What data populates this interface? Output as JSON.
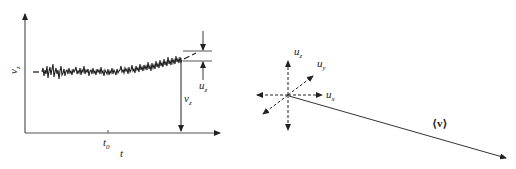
{
  "left_panel": {
    "y_axis_label": "v",
    "y_axis_label_sub": "z",
    "x_axis_label": "t",
    "x_tick_label": "t",
    "x_tick_label_sub": "0",
    "mean_label": "v",
    "mean_label_sub": "z",
    "fluct_label": "u",
    "fluct_label_sub": "z"
  },
  "right_panel": {
    "uz_label": "u",
    "uz_sub": "z",
    "uy_label": "u",
    "uy_sub": "y",
    "ux_label": "u",
    "ux_sub": "x",
    "mean_vector_label": "⟨v⟩"
  },
  "colors": {
    "ink": "#222222",
    "axis": "#555555",
    "background": "#ffffff"
  }
}
